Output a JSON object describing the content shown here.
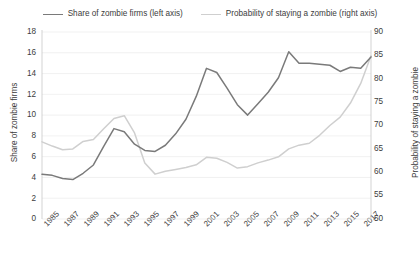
{
  "legend": {
    "position": "top-center",
    "entries": [
      {
        "label": "Share of zombie firms (left axis)",
        "color": "#7a7a7a",
        "name": "series-share"
      },
      {
        "label": "Probability of staying a zombie (right axis)",
        "color": "#cfcfcf",
        "name": "series-probability"
      }
    ]
  },
  "axes": {
    "left_title": "Share of zombie firms",
    "right_title": "Probability of staying a zombie",
    "left_ticks": [
      "18",
      "16",
      "14",
      "12",
      "10",
      "8",
      "6",
      "4",
      "2",
      "0"
    ],
    "right_ticks": [
      "90",
      "85",
      "80",
      "75",
      "70",
      "65",
      "60",
      "55",
      "50"
    ],
    "x_ticks": [
      "1985",
      "1987",
      "1989",
      "1991",
      "1993",
      "1995",
      "1997",
      "1999",
      "2001",
      "2003",
      "2005",
      "2007",
      "2009",
      "2011",
      "2013",
      "2015",
      "2017"
    ]
  },
  "chart_data": {
    "type": "line",
    "title": "",
    "subtitle": "",
    "xlabel": "",
    "ylabel": "Share of zombie firms",
    "y2label": "Probability of staying a zombie",
    "grid": true,
    "grid_axis": "y",
    "legend_position": "top-center",
    "xlim": [
      1985,
      2017
    ],
    "ylim": [
      0,
      18
    ],
    "y2lim": [
      50,
      90
    ],
    "ytick_values": [
      0,
      2,
      4,
      6,
      8,
      10,
      12,
      14,
      16,
      18
    ],
    "y2tick_values": [
      50,
      55,
      60,
      65,
      70,
      75,
      80,
      85,
      90
    ],
    "xtick_values": [
      1985,
      1987,
      1989,
      1991,
      1993,
      1995,
      1997,
      1999,
      2001,
      2003,
      2005,
      2007,
      2009,
      2011,
      2013,
      2015,
      2017
    ],
    "x": [
      1985,
      1986,
      1987,
      1988,
      1989,
      1990,
      1991,
      1992,
      1993,
      1994,
      1995,
      1996,
      1997,
      1998,
      1999,
      2000,
      2001,
      2002,
      2003,
      2004,
      2005,
      2006,
      2007,
      2008,
      2009,
      2010,
      2011,
      2012,
      2013,
      2014,
      2015,
      2016,
      2017
    ],
    "series": [
      {
        "name": "Share of zombie firms (left axis)",
        "axis": "left",
        "color": "#7a7a7a",
        "unit": "%",
        "values": [
          4.3,
          4.2,
          3.9,
          3.8,
          4.4,
          5.2,
          7.0,
          8.7,
          8.4,
          7.2,
          6.6,
          6.5,
          7.1,
          8.2,
          9.6,
          11.8,
          14.5,
          14.1,
          12.6,
          11.0,
          10.0,
          11.1,
          12.2,
          13.6,
          16.1,
          15.0,
          15.0,
          14.9,
          14.8,
          14.2,
          14.6,
          14.5,
          15.6
        ]
      },
      {
        "name": "Probability of staying a zombie (right axis)",
        "axis": "right",
        "color": "#cfcfcf",
        "unit": "%",
        "values": [
          66.5,
          65.6,
          64.8,
          65.0,
          66.6,
          67.0,
          69.3,
          71.5,
          72.1,
          68.4,
          62.0,
          59.6,
          60.2,
          60.6,
          61.0,
          61.6,
          63.2,
          63.0,
          62.1,
          60.9,
          61.2,
          62.0,
          62.6,
          63.3,
          65.0,
          65.8,
          66.2,
          67.9,
          70.0,
          71.8,
          74.8,
          79.0,
          84.9
        ]
      }
    ]
  }
}
